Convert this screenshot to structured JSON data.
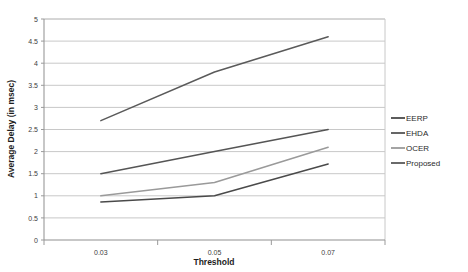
{
  "chart_data": {
    "type": "line",
    "title": "",
    "xlabel": "Threshold",
    "ylabel": "Average Delay (in msec)",
    "categories": [
      "0.03",
      "0.05",
      "0.07"
    ],
    "x": [
      0.03,
      0.05,
      0.07
    ],
    "ylim": [
      0,
      5
    ],
    "ytick_step": 0.5,
    "yticks": [
      "0",
      "0.5",
      "1",
      "1.5",
      "2",
      "2.5",
      "3",
      "3.5",
      "4",
      "4.5",
      "5"
    ],
    "ytick_values": [
      0,
      0.5,
      1,
      1.5,
      2,
      2.5,
      3,
      3.5,
      4,
      4.5,
      5
    ],
    "grid": "horizontal",
    "legend_position": "right",
    "series": [
      {
        "name": "EERP",
        "values": [
          0.86,
          1.0,
          1.72
        ],
        "color": "#4a4a4a"
      },
      {
        "name": "EHDA",
        "values": [
          1.5,
          2.0,
          2.5
        ],
        "color": "#555555"
      },
      {
        "name": "OCER",
        "values": [
          1.0,
          1.3,
          2.1
        ],
        "color": "#9a9a9a"
      },
      {
        "name": "Proposed",
        "values": [
          2.7,
          3.8,
          4.6
        ],
        "color": "#5a5a5a"
      }
    ]
  },
  "style": {
    "plot_background": "#ffffff",
    "gridline_color": "#c8c8c8",
    "axis_color": "#9a9a9a",
    "text_color": "#404040"
  }
}
